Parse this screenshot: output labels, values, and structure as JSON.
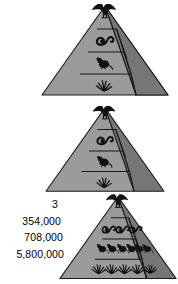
{
  "figure": {
    "type": "energy-pyramid-diagram",
    "pyramid_count": 3,
    "colors": {
      "front_face": "#9b9b9b",
      "right_face": "#767676",
      "outline": "#1a1a1a",
      "organism": "#111111",
      "background": "#ffffff",
      "label_text": "#000000"
    }
  },
  "labels": {
    "level_top": "3",
    "level_second": "354,000",
    "level_third": "708,000",
    "level_bottom": "5,800,000"
  },
  "pyramids": [
    {
      "id": "pyramid-1",
      "position": "top",
      "levels": [
        {
          "name": "tertiary-consumer",
          "organism": "hawk-icon",
          "count": 1
        },
        {
          "name": "secondary-consumer",
          "organism": "snake-icon",
          "count": 1
        },
        {
          "name": "primary-consumer",
          "organism": "mouse-icon",
          "count": 1
        },
        {
          "name": "producer",
          "organism": "grass-icon",
          "count": 1
        }
      ]
    },
    {
      "id": "pyramid-2",
      "position": "middle",
      "levels": [
        {
          "name": "tertiary-consumer",
          "organism": "hawk-icon",
          "count": 1
        },
        {
          "name": "secondary-consumer",
          "organism": "snake-icon",
          "count": 1
        },
        {
          "name": "primary-consumer",
          "organism": "mouse-icon",
          "count": 1
        },
        {
          "name": "producer",
          "organism": "grass-icon",
          "count": 1
        }
      ]
    },
    {
      "id": "pyramid-3",
      "position": "bottom",
      "labelled": true,
      "levels": [
        {
          "name": "tertiary-consumer",
          "organism": "hawk-icon",
          "count": 1,
          "label": "3"
        },
        {
          "name": "secondary-consumer",
          "organism": "snake-icon",
          "count": 4,
          "label": "354,000"
        },
        {
          "name": "primary-consumer",
          "organism": "mouse-icon",
          "count": 6,
          "label": "708,000"
        },
        {
          "name": "producer",
          "organism": "grass-icon",
          "count": 5,
          "label": "5,800,000"
        }
      ]
    }
  ]
}
